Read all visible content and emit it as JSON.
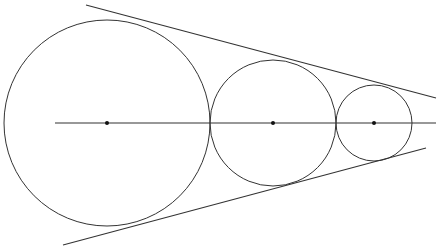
{
  "diagram": {
    "title": "",
    "stroke_color": "#333333",
    "axis": {
      "x1": 55,
      "y1": 123,
      "x2": 436,
      "y2": 123
    },
    "tangent_lines": [
      {
        "name": "upper",
        "x1": 86,
        "y1": 5,
        "x2": 436,
        "y2": 98
      },
      {
        "name": "lower",
        "x1": 63,
        "y1": 245,
        "x2": 426,
        "y2": 148
      }
    ],
    "circles": [
      {
        "name": "large",
        "cx": 107,
        "cy": 123,
        "r": 103
      },
      {
        "name": "medium",
        "cx": 273,
        "cy": 123,
        "r": 63
      },
      {
        "name": "small",
        "cx": 374,
        "cy": 123,
        "r": 38
      }
    ]
  }
}
